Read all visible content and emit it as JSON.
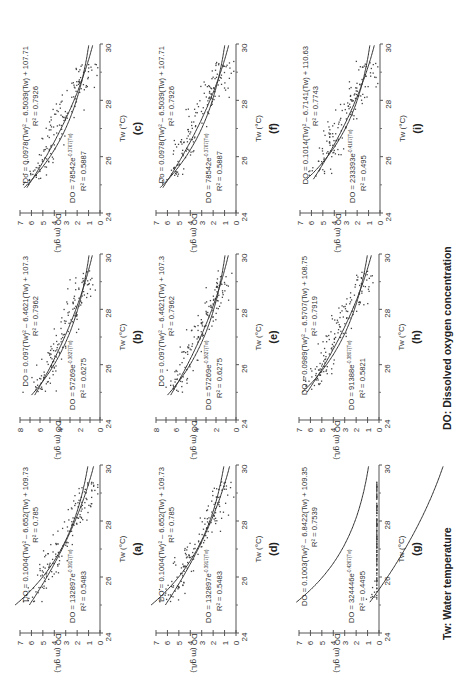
{
  "figure": {
    "rotation_deg": -90,
    "footer_legend": {
      "tw": "Tw: Water temperature",
      "do": "DO: Dissolved oxygen concentration"
    },
    "colors": {
      "axis": "#555555",
      "points": "#444444",
      "curve": "#333333",
      "text": "#333333"
    }
  },
  "chart_data": [
    {
      "panel": "(a)",
      "type": "scatter",
      "xlabel": "Tw (°C)",
      "ylabel": "DO (m g/L)",
      "xlim": [
        24,
        30
      ],
      "ylim": [
        0,
        7
      ],
      "xticks": [
        24,
        26,
        28,
        30
      ],
      "yticks": [
        0,
        1,
        2,
        3,
        4,
        5,
        6,
        7
      ],
      "poly_eq": "DO = 0.1004(Tw)² – 6.652(Tw) + 109.73",
      "poly_r2": "R² = 0.785",
      "poly": [
        0.1004,
        -6.652,
        109.73
      ],
      "exp_eq": "DO = 132897e",
      "exp_sup": "-0.3917(Tw)",
      "exp_r2": "R² = 0.5483",
      "exp": [
        132897,
        -0.3917
      ],
      "x_range": [
        25.1,
        29.4
      ]
    },
    {
      "panel": "(b)",
      "type": "scatter",
      "xlabel": "Tw (°C)",
      "ylabel": "DO (m g/L)",
      "xlim": [
        24,
        30
      ],
      "ylim": [
        0,
        8
      ],
      "xticks": [
        24,
        26,
        28,
        30
      ],
      "yticks": [
        0,
        2,
        4,
        6,
        8
      ],
      "poly_eq": "DO = 0.097(Tw)² – 6.4621(Tw) + 107.3",
      "poly_r2": "R² = 0.7962",
      "poly": [
        0.097,
        -6.4621,
        107.3
      ],
      "exp_eq": "DO = 57269e",
      "exp_sup": "-0.3627(Tw)",
      "exp_r2": "R² = 0.6275",
      "exp": [
        57269,
        -0.3627
      ],
      "x_range": [
        25.0,
        29.4
      ]
    },
    {
      "panel": "(c)",
      "type": "scatter",
      "xlabel": "Tw (°C)",
      "ylabel": "DO (m g/L)",
      "xlim": [
        24,
        30
      ],
      "ylim": [
        0,
        7
      ],
      "xticks": [
        24,
        26,
        28,
        30
      ],
      "yticks": [
        0,
        1,
        2,
        3,
        4,
        5,
        6,
        7
      ],
      "poly_eq": "Do = 0.0978(Tw)² – 6.5039(Tw) + 107.71",
      "poly_r2": "R² = 0.7926",
      "poly": [
        0.0978,
        -6.5039,
        107.71
      ],
      "exp_eq": "DO = 78542e",
      "exp_sup": "-0.3767(Tw)",
      "exp_r2": "R² = 0.5887",
      "exp": [
        78542,
        -0.3767
      ],
      "x_range": [
        25.0,
        29.4
      ]
    },
    {
      "panel": "(d)",
      "type": "scatter",
      "xlabel": "Tw (°C)",
      "ylabel": "DO (m g/L)",
      "xlim": [
        24,
        30
      ],
      "ylim": [
        0,
        7
      ],
      "xticks": [
        24,
        26,
        28,
        30
      ],
      "yticks": [
        0,
        1,
        2,
        3,
        4,
        5,
        6,
        7
      ],
      "poly_eq": "DO = 0.1004(Tw)² – 6.652(Tw) + 109.73",
      "poly_r2": "R² = 0.785",
      "poly": [
        0.1004,
        -6.652,
        109.73
      ],
      "exp_eq": "DO = 132897e",
      "exp_sup": "-0.3917(Tw)",
      "exp_r2": "R² = 0.5483",
      "exp": [
        132897,
        -0.3917
      ],
      "x_range": [
        25.1,
        29.4
      ]
    },
    {
      "panel": "(e)",
      "type": "scatter",
      "xlabel": "Tw (°C)",
      "ylabel": "DO (m g/L)",
      "xlim": [
        24,
        30
      ],
      "ylim": [
        0,
        8
      ],
      "xticks": [
        24,
        26,
        28,
        30
      ],
      "yticks": [
        0,
        2,
        4,
        6,
        8
      ],
      "poly_eq": "DO = 0.097(Tw)² – 6.4621(Tw) + 107.3",
      "poly_r2": "R² = 0.7962",
      "poly": [
        0.097,
        -6.4621,
        107.3
      ],
      "exp_eq": "DO = 57269e",
      "exp_sup": "-0.3627(Tw)",
      "exp_r2": "R² = 0.6275",
      "exp": [
        57269,
        -0.3627
      ],
      "x_range": [
        25.0,
        29.4
      ]
    },
    {
      "panel": "(f)",
      "type": "scatter",
      "xlabel": "Tw (°C)",
      "ylabel": "DO (m g/L)",
      "xlim": [
        24,
        30
      ],
      "ylim": [
        0,
        7
      ],
      "xticks": [
        24,
        26,
        28,
        30
      ],
      "yticks": [
        0,
        1,
        2,
        3,
        4,
        5,
        6,
        7
      ],
      "poly_eq": "Do = 0.0978(Tw)² – 6.5039(Tw) + 107.71",
      "poly_r2": "R² = 0.7926",
      "poly": [
        0.0978,
        -6.5039,
        107.71
      ],
      "exp_eq": "DO = 78542e",
      "exp_sup": "-0.3767(Tw)",
      "exp_r2": "R² = 0.5887",
      "exp": [
        78542,
        -0.3767
      ],
      "x_range": [
        25.0,
        29.4
      ]
    },
    {
      "panel": "(g)",
      "type": "scatter",
      "xlabel": "Tw (°C)",
      "ylabel": "DO (m g/L)",
      "xlim": [
        24,
        30
      ],
      "ylim": [
        0,
        7
      ],
      "xticks": [
        24,
        26,
        28,
        30
      ],
      "yticks": [
        0,
        1,
        2,
        3,
        4,
        5,
        6,
        7
      ],
      "poly_eq": "DO = 0.1003(Tw)² – 6.8422(Tw) + 109.35",
      "poly_r2": "R² = 0.7539",
      "poly": [
        0.1003,
        -6.8422,
        109.35
      ],
      "exp_eq": "DO = 324446e",
      "exp_sup": "-0.4267(Tw)",
      "exp_r2": "R² = 0.4495",
      "exp": [
        324446,
        -0.4267
      ],
      "x_range": [
        25.2,
        29.4
      ]
    },
    {
      "panel": "(h)",
      "type": "scatter",
      "xlabel": "Tw (°C)",
      "ylabel": "DO (m g/L)",
      "xlim": [
        24,
        30
      ],
      "ylim": [
        0,
        7
      ],
      "xticks": [
        24,
        26,
        28,
        30
      ],
      "yticks": [
        0,
        1,
        2,
        3,
        4,
        5,
        6,
        7
      ],
      "poly_eq": "DO = 0.0989(Tw)² – 6.5707(Tw) + 108.75",
      "poly_r2": "R² = 0.7919",
      "poly": [
        0.0989,
        -6.5707,
        108.75
      ],
      "exp_eq": "DO = 91388e",
      "exp_sup": "-0.3807(Tw)",
      "exp_r2": "R² = 0.5821",
      "exp": [
        91388,
        -0.3807
      ],
      "x_range": [
        25.1,
        29.4
      ]
    },
    {
      "panel": "(i)",
      "type": "scatter",
      "xlabel": "Tw (°C)",
      "ylabel": "DO (m g/L)",
      "xlim": [
        24,
        30
      ],
      "ylim": [
        0,
        7
      ],
      "xticks": [
        24,
        26,
        28,
        30
      ],
      "yticks": [
        0,
        1,
        2,
        3,
        4,
        5,
        6,
        7
      ],
      "poly_eq": "DO = 0.1014(Tw)² – 6.7141(Tw) + 110.63",
      "poly_r2": "R² = 0.7743",
      "poly": [
        0.1014,
        -6.7141,
        110.63
      ],
      "exp_eq": "DO = 233393e",
      "exp_sup": "-0.4167(Tw)",
      "exp_r2": "R² = 0.495",
      "exp": [
        233393,
        -0.4167
      ],
      "x_range": [
        25.3,
        29.4
      ]
    }
  ],
  "layout": {
    "panels": [
      {
        "id": "a",
        "axis_x": 100,
        "y24": 633,
        "y30": 465
      },
      {
        "id": "b",
        "axis_x": 100,
        "y24": 420,
        "y30": 254
      },
      {
        "id": "c",
        "axis_x": 100,
        "y24": 213,
        "y30": 44
      },
      {
        "id": "d",
        "axis_x": 236,
        "y24": 633,
        "y30": 465
      },
      {
        "id": "e",
        "axis_x": 236,
        "y24": 420,
        "y30": 254
      },
      {
        "id": "f",
        "axis_x": 236,
        "y24": 213,
        "y30": 44
      },
      {
        "id": "g",
        "axis_x": 379,
        "y24": 633,
        "y30": 465
      },
      {
        "id": "h",
        "axis_x": 379,
        "y24": 420,
        "y30": 254
      },
      {
        "id": "i",
        "axis_x": 380,
        "y24": 213,
        "y30": 44
      }
    ],
    "do_axis_length_px": 80
  }
}
